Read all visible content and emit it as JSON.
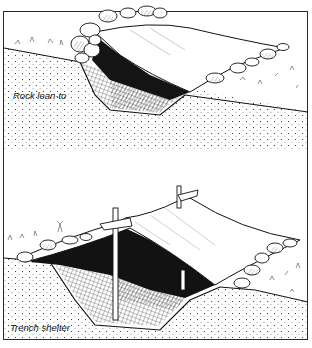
{
  "figure": {
    "type": "illustration",
    "style": "black-and-white pen-and-ink line drawing",
    "panels": [
      {
        "id": "rock-lean-to",
        "label": "Rock lean-to",
        "description": "A shallow trench dug into a slope; a fabric sheet is stretched over it, weighted on both edges by piled rocks; the space underneath is shaded dark."
      },
      {
        "id": "trench-shelter",
        "label": "Trench shelter",
        "description": "A trench with a fabric sheet stretched over two upright wooden poles and a ridge pole; one side weighted with rocks; dark hatched interior."
      }
    ]
  },
  "colors": {
    "ink": "#111111",
    "frame": "#2a2a2a",
    "paper": "#ffffff",
    "shade": "#1a1a1a"
  }
}
